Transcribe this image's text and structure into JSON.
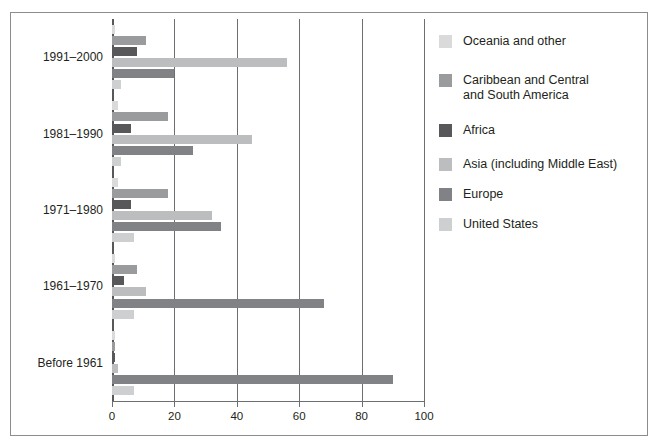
{
  "chart_data": {
    "type": "bar",
    "orientation": "horizontal",
    "title": "",
    "subtitle": "",
    "xlabel": "",
    "ylabel": "",
    "xlim": [
      0,
      100
    ],
    "xticks": [
      0,
      20,
      40,
      60,
      80,
      100
    ],
    "xtick_labels": [
      "0",
      "20",
      "40",
      "60",
      "80",
      "100"
    ],
    "grid": true,
    "grid_axis": "x",
    "legend_position": "right",
    "categories": [
      "1991–2000",
      "1981–1990",
      "1971–1980",
      "1961–1970",
      "Before 1961"
    ],
    "series": [
      {
        "name": "Oceania and other",
        "color": "#d9dad9",
        "values": [
          1,
          2,
          2,
          1,
          1
        ]
      },
      {
        "name": "Caribbean and Central\nand South America",
        "color": "#9a9b9c",
        "values": [
          11,
          18,
          18,
          8,
          1
        ]
      },
      {
        "name": "Africa",
        "color": "#58585b",
        "values": [
          8,
          6,
          6,
          4,
          1
        ]
      },
      {
        "name": "Asia (including Middle East)",
        "color": "#bcbdbf",
        "values": [
          56,
          45,
          32,
          11,
          2
        ]
      },
      {
        "name": "Europe",
        "color": "#808285",
        "values": [
          20,
          26,
          35,
          68,
          90
        ]
      },
      {
        "name": "United States",
        "color": "#cecfd0",
        "values": [
          3,
          3,
          7,
          7,
          7
        ]
      }
    ]
  },
  "legend": {
    "items": [
      {
        "label": "Oceania and other",
        "color": "#d9dad9"
      },
      {
        "label": "Caribbean and Central\nand South America",
        "color": "#9a9b9c"
      },
      {
        "label": "Africa",
        "color": "#58585b"
      },
      {
        "label": "Asia (including Middle East)",
        "color": "#bcbdbf"
      },
      {
        "label": "Europe",
        "color": "#808285"
      },
      {
        "label": "United States",
        "color": "#cecfd0"
      }
    ]
  }
}
